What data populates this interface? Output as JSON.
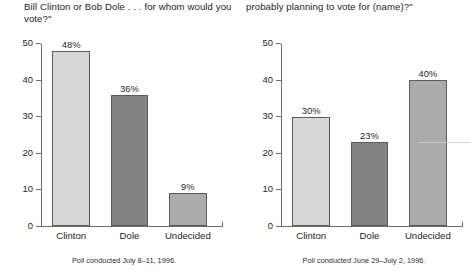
{
  "chart_data": [
    {
      "type": "bar",
      "title": "Bill Clinton or Bob Dole . . . for whom would you vote?\"",
      "categories": [
        "Clinton",
        "Dole",
        "Undecided"
      ],
      "values": [
        48,
        36,
        9
      ],
      "value_labels": [
        "48%",
        "36%",
        "9%"
      ],
      "bar_colors": [
        "#d8d8d8",
        "#848484",
        "#ababab"
      ],
      "yticks": [
        0,
        10,
        20,
        30,
        40,
        50
      ],
      "ytick_labels": [
        "0",
        "10",
        "20",
        "30",
        "40",
        "50"
      ],
      "ylim": [
        0,
        50
      ],
      "xlabel": "",
      "ylabel": "",
      "grid": false,
      "legend": false,
      "caption": "Poll conducted July 8–11, 1996."
    },
    {
      "type": "bar",
      "title": "probably planning to vote for (name)?\"",
      "categories": [
        "Clinton",
        "Dole",
        "Undecided"
      ],
      "values": [
        30,
        23,
        40
      ],
      "value_labels": [
        "30%",
        "23%",
        "40%"
      ],
      "bar_colors": [
        "#d8d8d8",
        "#848484",
        "#ababab"
      ],
      "yticks": [
        0,
        10,
        20,
        30,
        40,
        50
      ],
      "ytick_labels": [
        "0",
        "10",
        "20",
        "30",
        "40",
        "50"
      ],
      "ylim": [
        0,
        50
      ],
      "xlabel": "",
      "ylabel": "",
      "grid": false,
      "legend": false,
      "caption": "Poll conducted June 29–July 2, 1996."
    }
  ]
}
